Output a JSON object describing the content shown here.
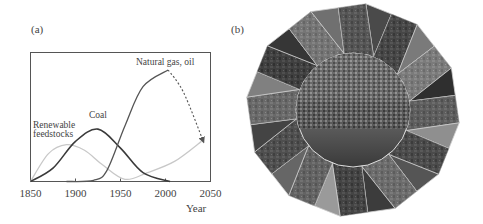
{
  "figure": {
    "panel_a_label": "(a)",
    "panel_b_label": "(b)"
  },
  "chart_data": {
    "type": "line",
    "title": "",
    "xlabel": "Year",
    "ylabel": "",
    "xlim": [
      1850,
      2050
    ],
    "ylim": [
      0,
      100
    ],
    "x_ticks": [
      1850,
      1900,
      1950,
      2000,
      2050
    ],
    "x_tick_labels": [
      "1850",
      "1900",
      "1950",
      "2000",
      "2050"
    ],
    "grid": false,
    "legend": "inline labels",
    "series": [
      {
        "name": "Renewable feedstocks",
        "label_lines": [
          "Renewable",
          "feedstocks"
        ],
        "color": "#c8c8c8",
        "style": "solid",
        "x": [
          1850,
          1870,
          1890,
          1910,
          1930,
          1955,
          1980,
          2010,
          2040
        ],
        "y": [
          0,
          25,
          33,
          28,
          15,
          2,
          8,
          18,
          36
        ]
      },
      {
        "name": "Coal",
        "label_lines": [
          "Coal"
        ],
        "color": "#3a3a3a",
        "style": "solid",
        "x": [
          1850,
          1875,
          1900,
          1925,
          1950,
          1975,
          2005
        ],
        "y": [
          0,
          12,
          36,
          47,
          30,
          8,
          0
        ]
      },
      {
        "name": "Natural gas, oil",
        "label_lines": [
          "Natural gas, oil"
        ],
        "color": "#555555",
        "style": "solid",
        "x": [
          1890,
          1920,
          1935,
          1955,
          1975,
          2003
        ],
        "y": [
          0,
          1,
          10,
          50,
          85,
          100
        ]
      },
      {
        "name": "Natural gas, oil (projection)",
        "label_lines": [],
        "color": "#555555",
        "style": "dashed-arrow",
        "x": [
          2003,
          2020,
          2042
        ],
        "y": [
          100,
          80,
          36
        ]
      }
    ]
  },
  "collage": {
    "description": "Grayscale 12-sided photo collage around a central city panorama",
    "center_photo": "city-aerial-view"
  }
}
